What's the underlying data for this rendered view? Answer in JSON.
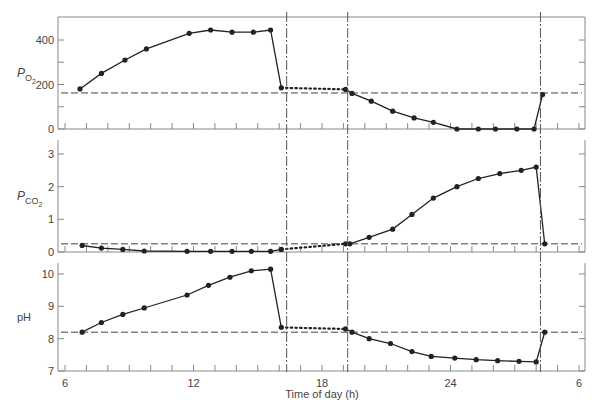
{
  "chart_data": {
    "type": "line",
    "title": "",
    "xlabel": "Time of day (h)",
    "x_ticks": [
      6,
      12,
      18,
      24,
      30
    ],
    "x_tick_labels": [
      "6",
      "12",
      "18",
      "24",
      "6"
    ],
    "xlim": [
      6,
      30
    ],
    "minor_tick_step_h": 1,
    "event_lines_h": [
      16.35,
      19.2,
      28.2
    ],
    "panels": [
      {
        "id": "po2",
        "ylabel": "PO2",
        "ylabel_main": "P",
        "ylabel_sub": "O2",
        "ylim": [
          0,
          500
        ],
        "y_ticks": [
          0,
          200,
          400
        ],
        "y_minor": [
          100,
          300
        ],
        "reference_level": 162,
        "series": [
          {
            "name": "day",
            "style": "solid",
            "x": [
              6.7,
              7.7,
              8.8,
              9.8,
              11.8,
              12.8,
              13.8,
              14.8,
              15.6,
              16.1
            ],
            "y": [
              180,
              250,
              310,
              360,
              430,
              445,
              435,
              435,
              445,
              185
            ]
          },
          {
            "name": "gap",
            "style": "dotted",
            "x": [
              16.1,
              19.1
            ],
            "y": [
              185,
              178
            ]
          },
          {
            "name": "night",
            "style": "solid",
            "x": [
              19.1,
              19.4,
              20.3,
              21.3,
              22.3,
              23.2,
              24.3,
              25.3,
              26.1,
              27.1,
              27.9,
              28.3
            ],
            "y": [
              178,
              160,
              125,
              80,
              50,
              30,
              0,
              0,
              0,
              0,
              0,
              155
            ]
          }
        ]
      },
      {
        "id": "pco2",
        "ylabel": "PCO2",
        "ylabel_main": "P",
        "ylabel_sub": "CO2",
        "ylim": [
          0,
          3.4
        ],
        "y_ticks": [
          0,
          1,
          2,
          3
        ],
        "y_minor": [],
        "reference_level": 0.25,
        "series": [
          {
            "name": "day",
            "style": "solid",
            "x": [
              6.8,
              7.7,
              8.7,
              9.7,
              11.7,
              12.8,
              13.8,
              14.7,
              15.6,
              16.1
            ],
            "y": [
              0.2,
              0.12,
              0.08,
              0.03,
              0.02,
              0.02,
              0.02,
              0.02,
              0.02,
              0.08
            ]
          },
          {
            "name": "gap",
            "style": "dotted",
            "x": [
              16.1,
              19.1
            ],
            "y": [
              0.08,
              0.25
            ]
          },
          {
            "name": "night",
            "style": "solid",
            "x": [
              19.1,
              19.3,
              20.2,
              21.3,
              22.2,
              23.2,
              24.3,
              25.3,
              26.3,
              27.3,
              28.0,
              28.4
            ],
            "y": [
              0.25,
              0.25,
              0.45,
              0.7,
              1.15,
              1.65,
              2.0,
              2.25,
              2.4,
              2.5,
              2.6,
              0.25
            ]
          }
        ]
      },
      {
        "id": "ph",
        "ylabel": "pH",
        "ylim": [
          7,
          10.3
        ],
        "y_ticks": [
          7,
          8,
          9,
          10
        ],
        "y_minor": [],
        "reference_level": 8.2,
        "series": [
          {
            "name": "day",
            "style": "solid",
            "x": [
              6.8,
              7.7,
              8.7,
              9.7,
              11.7,
              12.7,
              13.7,
              14.7,
              15.6,
              16.1
            ],
            "y": [
              8.2,
              8.5,
              8.75,
              8.95,
              9.35,
              9.65,
              9.9,
              10.1,
              10.15,
              8.35
            ]
          },
          {
            "name": "gap",
            "style": "dotted",
            "x": [
              16.1,
              19.1
            ],
            "y": [
              8.35,
              8.3
            ]
          },
          {
            "name": "night",
            "style": "solid",
            "x": [
              19.1,
              19.4,
              20.2,
              21.2,
              22.2,
              23.1,
              24.2,
              25.2,
              26.2,
              27.2,
              28.0,
              28.4
            ],
            "y": [
              8.3,
              8.2,
              8.0,
              7.85,
              7.6,
              7.45,
              7.4,
              7.35,
              7.32,
              7.3,
              7.28,
              8.2
            ]
          }
        ]
      }
    ]
  },
  "axis": {
    "xlabel": "Time of day (h)"
  },
  "panels_labels": {
    "po2_main": "P",
    "po2_sub": "O2",
    "pco2_main": "P",
    "pco2_sub": "CO2",
    "ph": "pH"
  },
  "colors": {
    "line": "#222222",
    "axis": "#888888",
    "dash": "#444444",
    "text": "#444444"
  }
}
